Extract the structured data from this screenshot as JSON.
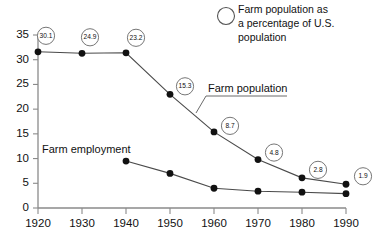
{
  "chart_data": {
    "type": "line",
    "title": "",
    "xlabel": "",
    "ylabel": "",
    "xlim": [
      1920,
      1990
    ],
    "ylim": [
      0,
      35
    ],
    "grid": false,
    "x": [
      1920,
      1930,
      1940,
      1950,
      1960,
      1970,
      1980,
      1990
    ],
    "xtick_labels": [
      "1920",
      "1930",
      "1940",
      "1950",
      "1960",
      "1970",
      "1980",
      "1990"
    ],
    "ytick_labels": [
      "0",
      "5",
      "10",
      "15",
      "20",
      "25",
      "30",
      "35"
    ],
    "yticks": [
      0,
      5,
      10,
      15,
      20,
      25,
      30,
      35
    ],
    "legend_position": "top-right",
    "series": [
      {
        "name": "Farm population",
        "x": [
          1920,
          1930,
          1940,
          1950,
          1960,
          1970,
          1980,
          1990
        ],
        "values": [
          31.6,
          31.3,
          31.4,
          23.0,
          15.4,
          9.8,
          6.1,
          4.8
        ],
        "point_labels": [
          "30.1",
          "24.9",
          "23.2",
          "15.3",
          "8.7",
          "4.8",
          "2.8",
          "1.9"
        ],
        "label_meaning": "Farm population as a percentage of U.S. population"
      },
      {
        "name": "Farm employment",
        "x": [
          1940,
          1950,
          1960,
          1970,
          1980,
          1990
        ],
        "values": [
          9.5,
          7.0,
          4.0,
          3.4,
          3.2,
          2.9
        ],
        "point_labels": [],
        "label_meaning": ""
      }
    ],
    "annotations": [
      {
        "text": "Farm population",
        "kind": "series-label"
      },
      {
        "text": "Farm employment",
        "kind": "series-label"
      }
    ]
  },
  "legend": {
    "marker": "open-circle",
    "line1": "Farm population as",
    "line2": "a percentage of U.S.",
    "line3": "population"
  },
  "labels": {
    "farm_population": "Farm population",
    "farm_employment": "Farm employment"
  },
  "colors": {
    "background": "#ffffff",
    "axis": "#8a8a8a",
    "line": "#4a4a4a",
    "point": "#111111",
    "callout_stroke": "#777777",
    "text": "#111111"
  }
}
